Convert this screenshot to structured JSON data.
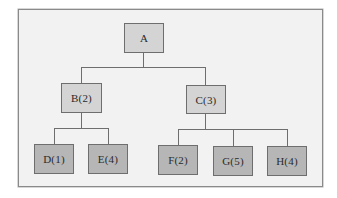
{
  "diagram": {
    "type": "tree",
    "colors": {
      "frame_background": "#f2f2f2",
      "frame_border": "#8a8a8a",
      "inner_node_fill": "#d4d4d4",
      "leaf_node_fill": "#b6b6b6",
      "node_border": "#6e6e6e",
      "connector": "#6e6e6e",
      "text": "#2a2a2a"
    },
    "nodes": {
      "A": {
        "label": "A",
        "parent": null,
        "level": 0
      },
      "B": {
        "label": "B(2)",
        "parent": "A",
        "level": 1
      },
      "C": {
        "label": "C(3)",
        "parent": "A",
        "level": 1
      },
      "D": {
        "label": "D(1)",
        "parent": "B",
        "level": 2
      },
      "E": {
        "label": "E(4)",
        "parent": "B",
        "level": 2
      },
      "F": {
        "label": "F(2)",
        "parent": "C",
        "level": 2
      },
      "G": {
        "label": "G(5)",
        "parent": "C",
        "level": 2
      },
      "H": {
        "label": "H(4)",
        "parent": "C",
        "level": 2
      }
    },
    "edges": [
      [
        "A",
        "B"
      ],
      [
        "A",
        "C"
      ],
      [
        "B",
        "D"
      ],
      [
        "B",
        "E"
      ],
      [
        "C",
        "F"
      ],
      [
        "C",
        "G"
      ],
      [
        "C",
        "H"
      ]
    ]
  }
}
